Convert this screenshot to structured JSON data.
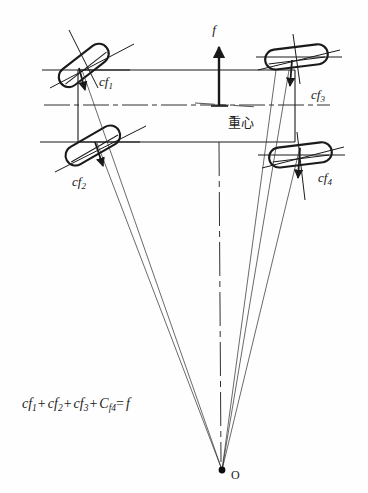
{
  "figure": {
    "title": "",
    "type": "vehicle-four-wheel-steering-force-diagram",
    "background_color": "#fefefe",
    "line_color": "#1a1a1a"
  },
  "labels": {
    "force_f": "f",
    "cf1": "cf",
    "cf1_sub": "1",
    "cf2": "cf",
    "cf2_sub": "2",
    "cf3": "cf",
    "cf3_sub": "3",
    "cf4": "cf",
    "cf4_sub": "4",
    "center_of_gravity": "重心",
    "origin_point": "O"
  },
  "equation": {
    "t1": "cf",
    "t1_sub": "1",
    "op1": "+",
    "t2": "cf",
    "t2_sub": "2",
    "op2": "+",
    "t3": "cf",
    "t3_sub": "3",
    "op3": "+",
    "t4": "C",
    "t4_sub": "f4",
    "op4": "=",
    "t5": "f",
    "full_text": "cf1+ cf2+ cf3+ Cf4= f"
  },
  "geometry": {
    "chassis": {
      "left": 78,
      "right": 295,
      "top": 70,
      "bottom": 142
    },
    "center_of_gravity_point": {
      "x": 219,
      "y": 106
    },
    "convergence_point_O": {
      "x": 222,
      "y": 470
    },
    "wheels": [
      {
        "name": "front-left",
        "cx": 83,
        "cy": 66,
        "angle": -38
      },
      {
        "name": "rear-left",
        "cx": 92,
        "cy": 146,
        "angle": -30
      },
      {
        "name": "front-right",
        "cx": 296,
        "cy": 57,
        "angle": -6
      },
      {
        "name": "rear-right",
        "cx": 300,
        "cy": 155,
        "angle": -6
      }
    ]
  }
}
